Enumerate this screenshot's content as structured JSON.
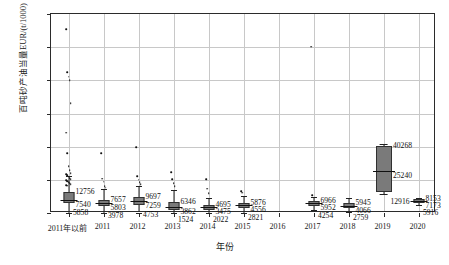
{
  "chart_data": {
    "type": "box",
    "title": "",
    "xlabel": "年份",
    "ylabel": "百吨砂产油当量EUR/(t/1000)",
    "ylim": [
      0,
      120000
    ],
    "yticks": [
      0,
      20000,
      40000,
      60000,
      80000,
      100000,
      120000
    ],
    "ytick_labels": [
      "0",
      "20000",
      "40000",
      "60000",
      "80000",
      "100000",
      "120000"
    ],
    "grid": "both",
    "legend": "none",
    "categories": [
      "2011年以前",
      "2011",
      "2012",
      "2013",
      "2014",
      "2015",
      "2016",
      "2017",
      "2018",
      "2019",
      "2020"
    ],
    "series": [
      {
        "name": "箱线图统计",
        "boxes": [
          {
            "category": "2011年以前",
            "q3": 12756,
            "median": 7540,
            "q1": 5858,
            "whisker_low": 300,
            "whisker_high": 22500,
            "outliers": [
              110900,
              84900,
              82200,
              80100,
              66200,
              48300,
              36000,
              28200,
              25900,
              24100,
              23300,
              22700,
              21900,
              21100,
              20400,
              19800,
              19100,
              18600,
              18000,
              17400,
              16900,
              16400
            ],
            "labels": {
              "q3": "12756",
              "median": "7540",
              "q1": "5858"
            }
          },
          {
            "category": "2011",
            "q3": 7657,
            "median": 5803,
            "q1": 3978,
            "whisker_low": 250,
            "whisker_high": 14500,
            "outliers": [
              36200,
              20600,
              18900,
              16300,
              15200
            ],
            "labels": {
              "q3": "7657",
              "median": "5803",
              "q1": "3978"
            }
          },
          {
            "category": "2012",
            "q3": 9697,
            "median": 7259,
            "q1": 4753,
            "whisker_low": 300,
            "whisker_high": 16500,
            "outliers": [
              39700,
              22100,
              20200,
              18400,
              17300
            ],
            "labels": {
              "q3": "9697",
              "median": "7259",
              "q1": "4753"
            }
          },
          {
            "category": "2013",
            "q3": 6346,
            "median": 3862,
            "q1": 1524,
            "whisker_low": 200,
            "whisker_high": 13800,
            "outliers": [
              24700,
              20300,
              18100,
              16200
            ],
            "labels": {
              "q3": "6346",
              "median": "3862",
              "q1": "1524"
            }
          },
          {
            "category": "2014",
            "q3": 4695,
            "median": 3475,
            "q1": 2022,
            "whisker_low": 200,
            "whisker_high": 9200,
            "outliers": [
              20400,
              14600,
              12100
            ],
            "labels": {
              "q3": "4695",
              "median": "3475",
              "q1": "2022"
            }
          },
          {
            "category": "2015",
            "q3": 5876,
            "median": 4556,
            "q1": 2821,
            "whisker_low": 250,
            "whisker_high": 10400,
            "outliers": [
              13100,
              12300
            ],
            "labels": {
              "q3": "5876",
              "median": "4556",
              "q1": "2821"
            }
          },
          {
            "category": "2016",
            "q3": null,
            "median": null,
            "q1": null,
            "whisker_low": null,
            "whisker_high": null,
            "outliers": [],
            "labels": {
              "q3": "",
              "median": "",
              "q1": ""
            }
          },
          {
            "category": "2017",
            "q3": 6966,
            "median": 5952,
            "q1": 4254,
            "whisker_low": 2100,
            "whisker_high": 9400,
            "outliers": [
              100400,
              10600
            ],
            "labels": {
              "q3": "6966",
              "median": "5952",
              "q1": "4254"
            }
          },
          {
            "category": "2018",
            "q3": 5945,
            "median": 4066,
            "q1": 2759,
            "whisker_low": 400,
            "whisker_high": 9100,
            "outliers": [],
            "labels": {
              "q3": "5945",
              "median": "4066",
              "q1": "2759"
            }
          },
          {
            "category": "2019",
            "q3": 40268,
            "median": 25240,
            "q1": 12916,
            "whisker_low": 11200,
            "whisker_high": 41500,
            "outliers": [],
            "labels": {
              "q3": "40268",
              "median": "25240",
              "q1": "12916"
            }
          },
          {
            "category": "2020",
            "q3": 8153,
            "median": 7173,
            "q1": 5916,
            "whisker_low": 4600,
            "whisker_high": 9300,
            "outliers": [],
            "labels": {
              "q3": "8153",
              "median": "7173",
              "q1": "5916"
            }
          }
        ]
      }
    ],
    "colors": {
      "box_fill": "#7a7a7a",
      "box_edge": "#303030",
      "median": "#101010",
      "point": "#111111",
      "grid": "#c8c8c8",
      "frame": "#2b2b2b",
      "text": "#1a1a1a"
    }
  }
}
